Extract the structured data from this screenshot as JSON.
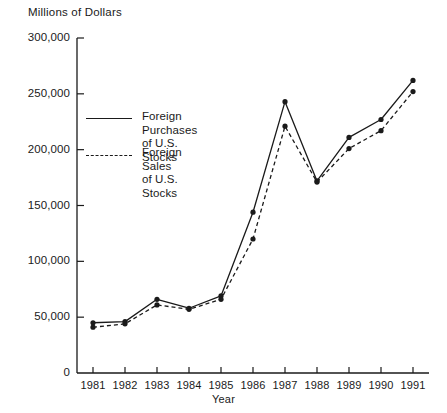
{
  "chart_data": {
    "type": "line",
    "title": "",
    "ylabel": "Millions of Dollars",
    "xlabel": "Year",
    "categories": [
      "1981",
      "1982",
      "1983",
      "1984",
      "1985",
      "1986",
      "1987",
      "1988",
      "1989",
      "1990",
      "1991"
    ],
    "ylim": [
      0,
      300000
    ],
    "xlim": [
      "1981",
      "1991"
    ],
    "grid": false,
    "legend_position": "inside-upper-left",
    "ytick_labels": [
      "300,000",
      "250,000",
      "200,000",
      "150,000",
      "100,000",
      "50,000",
      "0"
    ],
    "ytick_values": [
      300000,
      250000,
      200000,
      150000,
      100000,
      50000,
      0
    ],
    "series": [
      {
        "name": "Foreign Purchases\nof U.S. Stocks",
        "style": "solid",
        "marker": "filled-circle",
        "values": [
          45000,
          46000,
          66000,
          58000,
          69000,
          144000,
          243000,
          172000,
          211000,
          227000,
          262000
        ]
      },
      {
        "name": "Foreign Sales\nof U.S. Stocks",
        "style": "dashed",
        "marker": "filled-circle",
        "values": [
          41000,
          44000,
          61000,
          57000,
          66000,
          120000,
          221000,
          171000,
          201000,
          217000,
          252000
        ]
      }
    ]
  },
  "legend": {
    "items": [
      {
        "label": "Foreign Purchases\nof U.S. Stocks",
        "style": "solid"
      },
      {
        "label": "Foreign Sales\nof U.S. Stocks",
        "style": "dashed"
      }
    ]
  },
  "colors": {
    "ink": "#1a1a1a",
    "background": "#ffffff"
  }
}
